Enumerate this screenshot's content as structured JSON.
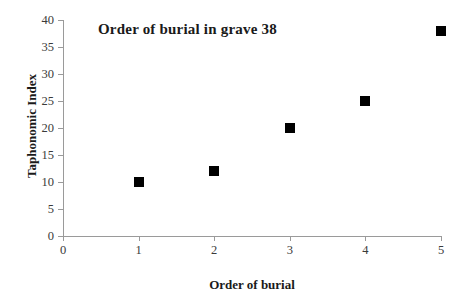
{
  "chart_data": {
    "type": "scatter",
    "title": "Order of burial in grave 38",
    "xlabel": "Order of burial",
    "ylabel": "Taphonomic Index",
    "x": [
      1,
      2,
      3,
      4,
      5
    ],
    "values": [
      10,
      12,
      20,
      25,
      38
    ],
    "points": [
      {
        "x": 1,
        "y": 10
      },
      {
        "x": 2,
        "y": 12
      },
      {
        "x": 3,
        "y": 20
      },
      {
        "x": 4,
        "y": 25
      },
      {
        "x": 5,
        "y": 38
      }
    ],
    "series": [
      {
        "name": "Taphonomic Index",
        "values": [
          10,
          12,
          20,
          25,
          38
        ]
      }
    ],
    "xlim": [
      0,
      5
    ],
    "ylim": [
      0,
      40
    ],
    "xticks": [
      0,
      1,
      2,
      3,
      4,
      5
    ],
    "yticks": [
      0,
      5,
      10,
      15,
      20,
      25,
      30,
      35,
      40
    ],
    "xtick_labels": [
      "0",
      "1",
      "2",
      "3",
      "4",
      "5"
    ],
    "ytick_labels": [
      "0",
      "5",
      "10",
      "15",
      "20",
      "25",
      "30",
      "35",
      "40"
    ],
    "grid": false,
    "legend": false,
    "marker": "filled-square",
    "marker_color": "#000000",
    "axis_color": "#9a9a9a",
    "background_color": "#ffffff"
  }
}
